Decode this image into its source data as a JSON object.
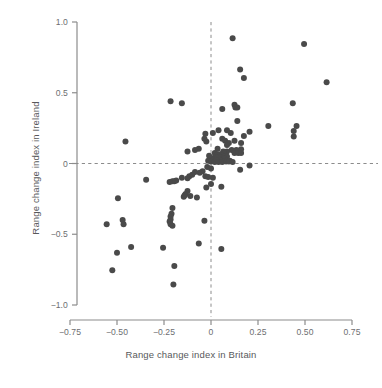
{
  "chart_data": {
    "type": "scatter",
    "title": "",
    "xlabel": "Range change index in Britain",
    "ylabel": "Range change index in Ireland",
    "xlim": [
      -0.85,
      0.8
    ],
    "ylim": [
      -1.08,
      1.05
    ],
    "xticks": [
      -0.75,
      -0.5,
      -0.25,
      0,
      0.25,
      0.5,
      0.75
    ],
    "xticklabels": [
      "−0.75",
      "−0.50",
      "−0.25",
      "0",
      "0.25",
      "0.50",
      "0.75"
    ],
    "yticks": [
      1.0,
      0.5,
      0,
      -0.5,
      -1.0
    ],
    "yticklabels": [
      "1.0",
      "0.5",
      "0",
      "−0.5",
      "−1.0"
    ],
    "grid": false,
    "legend": null,
    "reference_lines": [
      {
        "orientation": "vertical",
        "value": 0,
        "style": "dashed",
        "color": "#8c8c8c"
      },
      {
        "orientation": "horizontal",
        "value": 0,
        "style": "dashed",
        "color": "#8c8c8c"
      }
    ],
    "marker": {
      "shape": "circle",
      "size": 4.2,
      "color": "#4a4a4a"
    },
    "points": [
      [
        0.115,
        0.885
      ],
      [
        0.495,
        0.845
      ],
      [
        0.155,
        0.665
      ],
      [
        0.175,
        0.605
      ],
      [
        0.615,
        0.575
      ],
      [
        0.435,
        0.425
      ],
      [
        -0.215,
        0.44
      ],
      [
        -0.155,
        0.425
      ],
      [
        0.125,
        0.415
      ],
      [
        0.13,
        0.395
      ],
      [
        0.14,
        0.395
      ],
      [
        0.06,
        0.385
      ],
      [
        0.14,
        0.3
      ],
      [
        0.305,
        0.265
      ],
      [
        0.455,
        0.265
      ],
      [
        0.44,
        0.23
      ],
      [
        0.44,
        0.19
      ],
      [
        0.205,
        0.225
      ],
      [
        0.175,
        0.195
      ],
      [
        0.105,
        0.215
      ],
      [
        0.085,
        0.235
      ],
      [
        0.04,
        0.235
      ],
      [
        0.01,
        0.215
      ],
      [
        -0.03,
        0.21
      ],
      [
        -0.035,
        0.175
      ],
      [
        -0.025,
        0.155
      ],
      [
        0.06,
        0.175
      ],
      [
        0.075,
        0.16
      ],
      [
        0.095,
        0.145
      ],
      [
        0.085,
        0.13
      ],
      [
        0.125,
        0.16
      ],
      [
        0.16,
        0.145
      ],
      [
        0.16,
        0.1
      ],
      [
        0.135,
        0.095
      ],
      [
        0.11,
        0.095
      ],
      [
        0.085,
        0.085
      ],
      [
        0.065,
        0.085
      ],
      [
        0.035,
        0.105
      ],
      [
        -0.065,
        0.105
      ],
      [
        -0.085,
        0.095
      ],
      [
        -0.125,
        0.085
      ],
      [
        -0.455,
        0.155
      ],
      [
        0.02,
        0.075
      ],
      [
        0.035,
        0.065
      ],
      [
        0.05,
        0.065
      ],
      [
        0.06,
        0.055
      ],
      [
        0.07,
        0.05
      ],
      [
        0.085,
        0.05
      ],
      [
        0.02,
        0.045
      ],
      [
        0.035,
        0.04
      ],
      [
        0.05,
        0.04
      ],
      [
        0.06,
        0.03
      ],
      [
        0.07,
        0.035
      ],
      [
        0.015,
        0.03
      ],
      [
        0.03,
        0.025
      ],
      [
        0.045,
        0.025
      ],
      [
        0.055,
        0.02
      ],
      [
        0.075,
        0.02
      ],
      [
        0.0,
        0.035
      ],
      [
        -0.01,
        0.055
      ],
      [
        -0.015,
        0.02
      ],
      [
        0.0,
        0.015
      ],
      [
        0.02,
        0.01
      ],
      [
        0.04,
        0.01
      ],
      [
        0.06,
        0.01
      ],
      [
        0.08,
        0.015
      ],
      [
        0.1,
        0.02
      ],
      [
        0.125,
        0.075
      ],
      [
        0.145,
        0.075
      ],
      [
        0.16,
        0.075
      ],
      [
        0.095,
        0.015
      ],
      [
        0.115,
        0.01
      ],
      [
        0.205,
        -0.015
      ],
      [
        0.155,
        -0.045
      ],
      [
        0.0,
        -0.035
      ],
      [
        -0.02,
        -0.025
      ],
      [
        -0.045,
        -0.055
      ],
      [
        -0.06,
        -0.065
      ],
      [
        -0.085,
        -0.06
      ],
      [
        -0.1,
        -0.08
      ],
      [
        -0.115,
        -0.09
      ],
      [
        -0.125,
        -0.105
      ],
      [
        -0.155,
        -0.1
      ],
      [
        -0.185,
        -0.12
      ],
      [
        -0.195,
        -0.125
      ],
      [
        -0.205,
        -0.125
      ],
      [
        -0.22,
        -0.13
      ],
      [
        -0.345,
        -0.115
      ],
      [
        -0.03,
        -0.09
      ],
      [
        -0.015,
        -0.095
      ],
      [
        0.01,
        -0.1
      ],
      [
        0.055,
        -0.165
      ],
      [
        0.0,
        -0.145
      ],
      [
        -0.025,
        -0.17
      ],
      [
        -0.125,
        -0.195
      ],
      [
        -0.135,
        -0.215
      ],
      [
        -0.14,
        -0.225
      ],
      [
        -0.145,
        -0.235
      ],
      [
        -0.11,
        -0.23
      ],
      [
        -0.075,
        -0.24
      ],
      [
        -0.495,
        -0.245
      ],
      [
        -0.205,
        -0.315
      ],
      [
        -0.21,
        -0.355
      ],
      [
        -0.215,
        -0.375
      ],
      [
        -0.215,
        -0.395
      ],
      [
        -0.22,
        -0.41
      ],
      [
        -0.215,
        -0.43
      ],
      [
        -0.205,
        -0.44
      ],
      [
        -0.035,
        -0.405
      ],
      [
        -0.555,
        -0.43
      ],
      [
        -0.47,
        -0.4
      ],
      [
        -0.465,
        -0.43
      ],
      [
        -0.065,
        -0.565
      ],
      [
        0.055,
        -0.605
      ],
      [
        -0.255,
        -0.595
      ],
      [
        -0.425,
        -0.59
      ],
      [
        -0.5,
        -0.63
      ],
      [
        -0.195,
        -0.725
      ],
      [
        -0.525,
        -0.755
      ],
      [
        -0.2,
        -0.855
      ]
    ]
  }
}
